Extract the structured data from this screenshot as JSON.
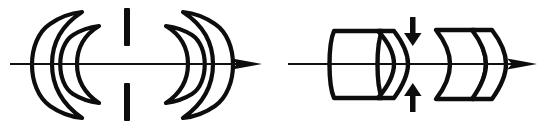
{
  "figure": {
    "title": "Optical lens system schematic diagrams",
    "background_color": "#ffffff",
    "stroke_color": "#0d0d0d",
    "width": 546,
    "height": 129,
    "panel_count": 2
  },
  "panels": [
    {
      "id": "panel-left",
      "name": "left-lens-system",
      "label": "",
      "axis": {
        "name": "optical-axis",
        "y": 64,
        "x_start": 10,
        "x_end": 262,
        "arrowhead": "right"
      },
      "elements": [
        {
          "name": "meniscus-lens-1",
          "type": "negative-meniscus",
          "side": "front-outer",
          "orientation": "concave-right"
        },
        {
          "name": "meniscus-lens-2",
          "type": "negative-meniscus",
          "side": "front-inner",
          "orientation": "concave-right"
        },
        {
          "name": "aperture-stop-upper",
          "type": "stop-bar",
          "orientation": "vertical"
        },
        {
          "name": "aperture-stop-lower",
          "type": "stop-bar",
          "orientation": "vertical"
        },
        {
          "name": "meniscus-lens-3",
          "type": "negative-meniscus",
          "side": "rear-inner",
          "orientation": "concave-left"
        },
        {
          "name": "meniscus-lens-4",
          "type": "negative-meniscus",
          "side": "rear-outer",
          "orientation": "concave-left"
        }
      ]
    },
    {
      "id": "panel-right",
      "name": "right-lens-system",
      "label": "",
      "axis": {
        "name": "optical-axis",
        "y": 64,
        "x_start": 288,
        "x_end": 537,
        "arrowhead": "right"
      },
      "elements": [
        {
          "name": "thick-element-1",
          "type": "plano-element",
          "orientation": "flat-left-curved-right"
        },
        {
          "name": "meniscus-lens-1",
          "type": "negative-meniscus",
          "orientation": "concave-left"
        },
        {
          "name": "stop-arrow-down",
          "type": "aperture-indicator-arrow",
          "direction": "down"
        },
        {
          "name": "stop-arrow-up",
          "type": "aperture-indicator-arrow",
          "direction": "up"
        },
        {
          "name": "biconvex-element",
          "type": "positive-lens",
          "orientation": "concave-left-convex-right"
        },
        {
          "name": "rear-convex-element",
          "type": "positive-lens",
          "orientation": "biconvex"
        }
      ]
    }
  ],
  "colors": {
    "ink": "#0d0d0d",
    "paper": "#ffffff",
    "axis": "#111111"
  }
}
